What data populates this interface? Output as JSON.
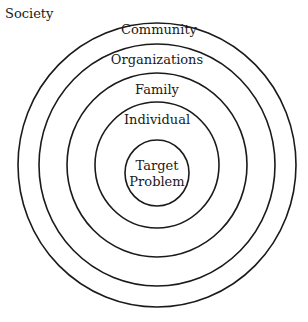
{
  "diagram": {
    "type": "concentric-circles",
    "outer_label": "Society",
    "rings": [
      {
        "label": "Community",
        "rx": 139,
        "ry": 142
      },
      {
        "label": "Organizations",
        "rx": 118,
        "ry": 121
      },
      {
        "label": "Family",
        "rx": 90,
        "ry": 92
      },
      {
        "label": "Individual",
        "rx": 62,
        "ry": 63
      },
      {
        "label": "Target Problem",
        "rx": 32,
        "ry": 33
      }
    ],
    "center_label_line1": "Target",
    "center_label_line2": "Problem",
    "stroke_color": "#1a1a1a",
    "background": "#ffffff"
  }
}
